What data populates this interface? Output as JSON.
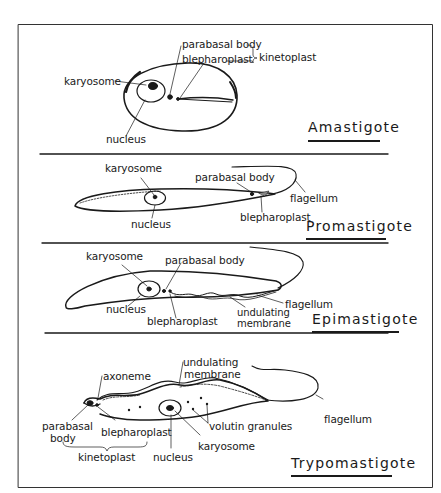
{
  "colors": {
    "ink": "#1a1a1a",
    "background": "#ffffff",
    "frame": "#333333"
  },
  "stages": [
    {
      "id": "amastigote",
      "title": "Amastigote",
      "labels": {
        "karyosome": "karyosome",
        "nucleus": "nucleus",
        "parabasal_body": "parabasal body",
        "blepharoplast": "blepharoplast",
        "kinetoplast": "kinetoplast"
      }
    },
    {
      "id": "promastigote",
      "title": "Promastigote",
      "labels": {
        "karyosome": "karyosome",
        "nucleus": "nucleus",
        "parabasal_body": "parabasal  body",
        "blepharoplast": "blepharoplast",
        "flagellum": "flagellum"
      }
    },
    {
      "id": "epimastigote",
      "title": "Epimastigote",
      "labels": {
        "karyosome": "karyosome",
        "nucleus": "nucleus",
        "parabasal_body": "parabasal  body",
        "blepharoplast": "blepharoplast",
        "undulating_membrane_1": "undulating",
        "undulating_membrane_2": "membrane",
        "flagellum": "flagellum"
      }
    },
    {
      "id": "trypomastigote",
      "title": "Trypomastigote",
      "labels": {
        "axoneme": "axoneme",
        "undulating_membrane_1": "undulating",
        "undulating_membrane_2": "membrane",
        "parabasal_body_1": "parabasal",
        "parabasal_body_2": "body",
        "blepharoplast": "blepharoplast",
        "kinetoplast": "kinetoplast",
        "nucleus": "nucleus",
        "karyosome": "karyosome",
        "volutin_granules": "volutin  granules",
        "flagellum": "flagellum"
      }
    }
  ]
}
